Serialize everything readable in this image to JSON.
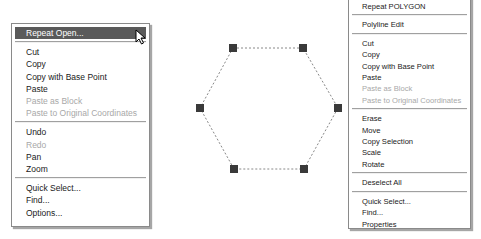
{
  "left_menu": {
    "items": [
      {
        "label": "Repeat Open...",
        "state": "highlighted"
      },
      {
        "label": "Cut",
        "state": "enabled"
      },
      {
        "label": "Copy",
        "state": "enabled"
      },
      {
        "label": "Copy with Base Point",
        "state": "enabled"
      },
      {
        "label": "Paste",
        "state": "enabled"
      },
      {
        "label": "Paste as Block",
        "state": "disabled"
      },
      {
        "label": "Paste to Original Coordinates",
        "state": "disabled"
      },
      {
        "label": "Undo",
        "state": "enabled"
      },
      {
        "label": "Redo",
        "state": "disabled"
      },
      {
        "label": "Pan",
        "state": "enabled"
      },
      {
        "label": "Zoom",
        "state": "enabled"
      },
      {
        "label": "Quick Select...",
        "state": "enabled"
      },
      {
        "label": "Find...",
        "state": "enabled"
      },
      {
        "label": "Options...",
        "state": "enabled"
      }
    ]
  },
  "right_menu": {
    "items": [
      {
        "label": "Repeat POLYGON",
        "state": "enabled"
      },
      {
        "label": "Polyline Edit",
        "state": "enabled"
      },
      {
        "label": "Cut",
        "state": "enabled"
      },
      {
        "label": "Copy",
        "state": "enabled"
      },
      {
        "label": "Copy with Base Point",
        "state": "enabled"
      },
      {
        "label": "Paste",
        "state": "enabled"
      },
      {
        "label": "Paste as Block",
        "state": "disabled"
      },
      {
        "label": "Paste to Original Coordinates",
        "state": "disabled"
      },
      {
        "label": "Erase",
        "state": "enabled"
      },
      {
        "label": "Move",
        "state": "enabled"
      },
      {
        "label": "Copy Selection",
        "state": "enabled"
      },
      {
        "label": "Scale",
        "state": "enabled"
      },
      {
        "label": "Rotate",
        "state": "enabled"
      },
      {
        "label": "Deselect All",
        "state": "enabled"
      },
      {
        "label": "Quick Select...",
        "state": "enabled"
      },
      {
        "label": "Find...",
        "state": "enabled"
      },
      {
        "label": "Properties",
        "state": "enabled"
      }
    ]
  },
  "drawing": {
    "shape": "hexagon",
    "grip_color": "#3a3a3a",
    "line_color": "#888888"
  }
}
